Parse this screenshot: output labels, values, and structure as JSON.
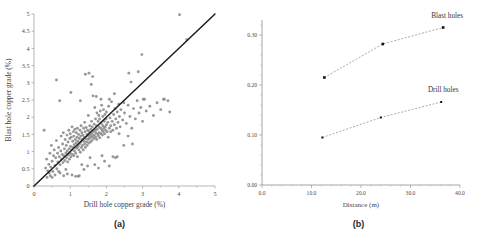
{
  "figure": {
    "panel_a_caption": "(a)",
    "panel_b_caption": "(b)"
  },
  "panel_a": {
    "xlabel": "Drill hole copper grade (%)",
    "ylabel": "Blast hole copper grade (%)",
    "xticks": [
      "0",
      "1",
      "2",
      "3",
      "4",
      "5"
    ],
    "yticks": [
      "0",
      "0.5",
      "1",
      "1.5",
      "2",
      "2.5",
      "3",
      "3.5",
      "4",
      "4.5",
      "5"
    ]
  },
  "panel_b": {
    "xlabel": "Distance (m)",
    "ylabel": "Variogram",
    "xticks": [
      "0.0",
      "10.0",
      "20.0",
      "30.0",
      "40.0"
    ],
    "yticks": [
      "0.00",
      "0.10",
      "0.20",
      "0.30"
    ],
    "series_label_blast": "Blast holes",
    "series_label_drill": "Drill holes"
  },
  "colors": {
    "scatter_marker": "#8a8a8a",
    "reference_line": "#1c1c1c",
    "variogram_marker": "#111111",
    "variogram_line": "#6f6f6f",
    "axis": "#9a9a9a"
  },
  "chart_data": [
    {
      "type": "scatter",
      "title": "(a)",
      "xlabel": "Drill hole copper grade (%)",
      "ylabel": "Blast hole copper grade (%)",
      "xlim": [
        0,
        5
      ],
      "ylim": [
        0,
        5
      ],
      "xticks": [
        0,
        1,
        2,
        3,
        4,
        5
      ],
      "yticks": [
        0,
        0.5,
        1,
        1.5,
        2,
        2.5,
        3,
        3.5,
        4,
        4.5,
        5
      ],
      "grid": false,
      "legend": "none",
      "reference_line": {
        "type": "1:1 identity",
        "x": [
          0,
          5
        ],
        "y": [
          0,
          5
        ]
      },
      "points": [
        [
          0.28,
          1.62
        ],
        [
          0.32,
          0.52
        ],
        [
          0.35,
          0.78
        ],
        [
          0.38,
          0.44
        ],
        [
          0.41,
          0.63
        ],
        [
          0.44,
          0.95
        ],
        [
          0.46,
          0.55
        ],
        [
          0.48,
          1.18
        ],
        [
          0.5,
          0.72
        ],
        [
          0.52,
          0.42
        ],
        [
          0.54,
          0.88
        ],
        [
          0.56,
          1.05
        ],
        [
          0.58,
          0.6
        ],
        [
          0.6,
          0.82
        ],
        [
          0.62,
          1.32
        ],
        [
          0.63,
          0.5
        ],
        [
          0.65,
          0.95
        ],
        [
          0.66,
          0.7
        ],
        [
          0.68,
          1.12
        ],
        [
          0.7,
          0.85
        ],
        [
          0.71,
          2.48
        ],
        [
          0.72,
          0.62
        ],
        [
          0.74,
          1.02
        ],
        [
          0.75,
          1.45
        ],
        [
          0.76,
          0.78
        ],
        [
          0.78,
          0.92
        ],
        [
          0.79,
          1.22
        ],
        [
          0.8,
          0.68
        ],
        [
          0.81,
          1.55
        ],
        [
          0.82,
          0.88
        ],
        [
          0.84,
          1.08
        ],
        [
          0.85,
          0.74
        ],
        [
          0.86,
          1.35
        ],
        [
          0.88,
          0.96
        ],
        [
          0.89,
          1.18
        ],
        [
          0.9,
          0.82
        ],
        [
          0.91,
          1.48
        ],
        [
          0.92,
          1.02
        ],
        [
          0.93,
          0.7
        ],
        [
          0.94,
          1.28
        ],
        [
          0.95,
          0.9
        ],
        [
          0.96,
          1.62
        ],
        [
          0.97,
          1.08
        ],
        [
          0.98,
          0.78
        ],
        [
          0.99,
          1.38
        ],
        [
          1.0,
          0.95
        ],
        [
          1.0,
          1.52
        ],
        [
          1.01,
          1.15
        ],
        [
          1.02,
          0.85
        ],
        [
          1.03,
          1.42
        ],
        [
          1.04,
          1.05
        ],
        [
          1.05,
          1.72
        ],
        [
          1.06,
          0.92
        ],
        [
          1.07,
          1.3
        ],
        [
          1.08,
          1.12
        ],
        [
          1.09,
          1.58
        ],
        [
          1.1,
          0.88
        ],
        [
          1.1,
          1.45
        ],
        [
          1.11,
          1.2
        ],
        [
          1.12,
          1.02
        ],
        [
          1.13,
          1.65
        ],
        [
          1.14,
          1.35
        ],
        [
          1.15,
          0.95
        ],
        [
          1.16,
          1.25
        ],
        [
          1.17,
          1.55
        ],
        [
          1.18,
          1.1
        ],
        [
          1.19,
          1.42
        ],
        [
          1.2,
          0.85
        ],
        [
          1.2,
          1.68
        ],
        [
          1.21,
          1.3
        ],
        [
          1.22,
          1.15
        ],
        [
          1.23,
          1.5
        ],
        [
          1.24,
          1.05
        ],
        [
          1.25,
          1.38
        ],
        [
          1.26,
          1.22
        ],
        [
          1.27,
          1.62
        ],
        [
          1.28,
          0.98
        ],
        [
          1.29,
          1.45
        ],
        [
          1.3,
          1.28
        ],
        [
          1.3,
          1.75
        ],
        [
          1.31,
          1.12
        ],
        [
          1.32,
          1.55
        ],
        [
          1.33,
          1.35
        ],
        [
          1.34,
          1.18
        ],
        [
          1.35,
          1.48
        ],
        [
          1.36,
          1.05
        ],
        [
          1.37,
          1.68
        ],
        [
          1.38,
          1.3
        ],
        [
          1.39,
          1.42
        ],
        [
          1.4,
          1.22
        ],
        [
          1.4,
          1.85
        ],
        [
          1.41,
          1.58
        ],
        [
          1.42,
          1.12
        ],
        [
          1.43,
          1.38
        ],
        [
          1.44,
          1.7
        ],
        [
          1.45,
          1.28
        ],
        [
          1.46,
          1.5
        ],
        [
          1.47,
          1.18
        ],
        [
          1.48,
          1.62
        ],
        [
          1.49,
          1.35
        ],
        [
          1.5,
          1.45
        ],
        [
          1.5,
          2.05
        ],
        [
          1.51,
          1.25
        ],
        [
          1.52,
          1.58
        ],
        [
          1.53,
          1.38
        ],
        [
          1.54,
          1.75
        ],
        [
          1.55,
          1.48
        ],
        [
          1.56,
          1.28
        ],
        [
          1.57,
          1.65
        ],
        [
          1.58,
          1.42
        ],
        [
          1.59,
          1.88
        ],
        [
          1.6,
          1.52
        ],
        [
          1.6,
          1.32
        ],
        [
          1.61,
          1.72
        ],
        [
          1.62,
          1.45
        ],
        [
          1.63,
          2.62
        ],
        [
          1.64,
          1.58
        ],
        [
          1.65,
          1.38
        ],
        [
          1.66,
          1.8
        ],
        [
          1.67,
          1.48
        ],
        [
          1.68,
          2.28
        ],
        [
          1.69,
          1.62
        ],
        [
          1.7,
          1.42
        ],
        [
          1.7,
          1.95
        ],
        [
          1.71,
          1.55
        ],
        [
          1.72,
          1.75
        ],
        [
          1.73,
          1.35
        ],
        [
          1.74,
          2.12
        ],
        [
          1.75,
          1.65
        ],
        [
          1.76,
          1.5
        ],
        [
          1.77,
          1.88
        ],
        [
          1.78,
          1.45
        ],
        [
          1.79,
          2.05
        ],
        [
          1.8,
          1.72
        ],
        [
          1.8,
          1.55
        ],
        [
          1.81,
          1.95
        ],
        [
          1.82,
          1.4
        ],
        [
          1.83,
          2.18
        ],
        [
          1.84,
          1.68
        ],
        [
          1.85,
          1.52
        ],
        [
          1.86,
          1.82
        ],
        [
          1.87,
          2.35
        ],
        [
          1.88,
          1.62
        ],
        [
          1.89,
          1.48
        ],
        [
          1.9,
          2.02
        ],
        [
          1.9,
          1.75
        ],
        [
          1.91,
          1.58
        ],
        [
          1.92,
          2.22
        ],
        [
          1.93,
          1.68
        ],
        [
          1.94,
          1.88
        ],
        [
          1.95,
          1.52
        ],
        [
          1.96,
          2.08
        ],
        [
          1.97,
          1.72
        ],
        [
          1.98,
          1.62
        ],
        [
          1.99,
          1.95
        ],
        [
          2.0,
          1.78
        ],
        [
          2.0,
          2.15
        ],
        [
          2.02,
          1.58
        ],
        [
          2.04,
          1.85
        ],
        [
          2.06,
          2.32
        ],
        [
          2.08,
          1.68
        ],
        [
          2.1,
          1.98
        ],
        [
          2.12,
          1.75
        ],
        [
          2.14,
          2.45
        ],
        [
          2.16,
          1.88
        ],
        [
          2.18,
          1.62
        ],
        [
          2.2,
          2.08
        ],
        [
          2.22,
          1.78
        ],
        [
          2.24,
          2.25
        ],
        [
          2.26,
          1.95
        ],
        [
          2.28,
          1.68
        ],
        [
          2.3,
          2.15
        ],
        [
          2.32,
          1.85
        ],
        [
          2.34,
          2.38
        ],
        [
          2.36,
          2.02
        ],
        [
          2.38,
          1.72
        ],
        [
          2.4,
          2.22
        ],
        [
          2.45,
          1.92
        ],
        [
          2.5,
          2.12
        ],
        [
          2.55,
          1.82
        ],
        [
          2.6,
          2.35
        ],
        [
          2.65,
          2.02
        ],
        [
          2.7,
          1.68
        ],
        [
          2.75,
          2.25
        ],
        [
          2.8,
          1.95
        ],
        [
          2.85,
          2.48
        ],
        [
          2.9,
          2.12
        ],
        [
          2.95,
          2.28
        ],
        [
          3.0,
          1.88
        ],
        [
          3.05,
          2.52
        ],
        [
          3.1,
          2.18
        ],
        [
          3.2,
          2.32
        ],
        [
          3.3,
          2.05
        ],
        [
          3.4,
          2.42
        ],
        [
          3.5,
          2.22
        ],
        [
          3.6,
          2.52
        ],
        [
          3.7,
          2.48
        ],
        [
          3.75,
          2.15
        ],
        [
          0.62,
          3.08
        ],
        [
          1.02,
          2.72
        ],
        [
          1.28,
          2.48
        ],
        [
          1.42,
          3.25
        ],
        [
          1.52,
          3.28
        ],
        [
          1.58,
          2.95
        ],
        [
          1.62,
          3.18
        ],
        [
          1.72,
          2.6
        ],
        [
          1.85,
          2.52
        ],
        [
          2.08,
          2.52
        ],
        [
          2.22,
          2.68
        ],
        [
          2.48,
          2.42
        ],
        [
          2.62,
          3.28
        ],
        [
          2.68,
          3.02
        ],
        [
          2.88,
          3.32
        ],
        [
          2.98,
          3.82
        ],
        [
          3.02,
          2.52
        ],
        [
          3.58,
          2.52
        ],
        [
          4.02,
          4.98
        ],
        [
          4.22,
          4.25
        ],
        [
          1.48,
          0.58
        ],
        [
          1.55,
          0.82
        ],
        [
          1.68,
          0.62
        ],
        [
          1.78,
          0.52
        ],
        [
          1.88,
          0.88
        ],
        [
          1.95,
          0.72
        ],
        [
          2.08,
          0.58
        ],
        [
          2.18,
          0.85
        ],
        [
          2.25,
          0.82
        ],
        [
          2.3,
          0.85
        ],
        [
          2.48,
          1.18
        ],
        [
          2.6,
          1.45
        ],
        [
          2.72,
          1.22
        ],
        [
          0.82,
          0.3
        ],
        [
          1.15,
          0.28
        ],
        [
          1.22,
          0.28
        ],
        [
          1.25,
          0.3
        ],
        [
          0.92,
          0.35
        ],
        [
          1.05,
          0.32
        ],
        [
          0.58,
          0.32
        ],
        [
          0.45,
          0.3
        ],
        [
          0.5,
          0.25
        ],
        [
          0.36,
          0.25
        ],
        [
          0.42,
          0.38
        ],
        [
          0.68,
          0.42
        ],
        [
          0.88,
          0.48
        ],
        [
          1.32,
          0.62
        ],
        [
          1.38,
          0.48
        ],
        [
          0.72,
          0.38
        ],
        [
          2.12,
          1.58
        ],
        [
          2.35,
          1.52
        ],
        [
          2.05,
          1.42
        ]
      ]
    },
    {
      "type": "line",
      "title": "(b)",
      "xlabel": "Distance (m)",
      "ylabel": "Variogram",
      "xlim": [
        0,
        40
      ],
      "ylim": [
        0,
        0.33
      ],
      "xticks": [
        0,
        10,
        20,
        30,
        40
      ],
      "yticks": [
        0.0,
        0.1,
        0.2,
        0.3
      ],
      "grid": false,
      "legend": "inline-labels",
      "series": [
        {
          "name": "Blast holes",
          "x": [
            12.6,
            24.4,
            36.6
          ],
          "values": [
            0.215,
            0.282,
            0.315
          ]
        },
        {
          "name": "Drill holes",
          "x": [
            12.2,
            24.0,
            36.2
          ],
          "values": [
            0.095,
            0.135,
            0.166
          ]
        }
      ]
    }
  ]
}
